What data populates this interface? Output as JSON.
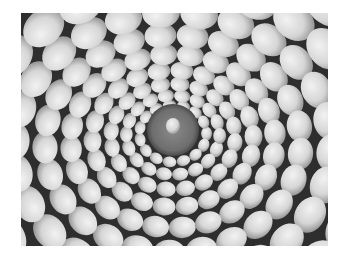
{
  "image": {
    "subject": "Grayscale photograph of smooth pebbles arranged in concentric spiral rings around a dark circular center holding a single pebble",
    "background_color": "#ffffff",
    "photo_frame": {
      "x": 21,
      "y": 13,
      "width": 307,
      "height": 233
    },
    "center": {
      "x": 152,
      "y": 117,
      "ring_radius": 26,
      "ring_color": "#7a7a7a"
    },
    "palette": {
      "pebble_light": "#e6e6e6",
      "pebble_mid": "#c4c4c4",
      "gap_dark": "#2a2a2a"
    }
  }
}
